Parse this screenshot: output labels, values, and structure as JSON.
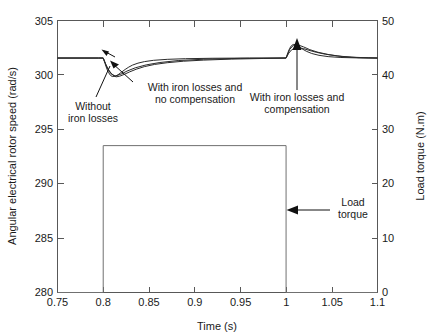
{
  "chart_data": {
    "type": "line",
    "title": "",
    "xlabel": "Time (s)",
    "ylabel": "Angular electrical rotor speed (rad/s)",
    "y2label": "Load torque (N.m)",
    "xlim": [
      0.75,
      1.1
    ],
    "ylim": [
      280,
      305
    ],
    "y2lim": [
      0,
      50
    ],
    "xticks": [
      "0.75",
      "0.8",
      "0.85",
      "0.9",
      "0.95",
      "1",
      "1.05",
      "1.1"
    ],
    "xtick_values": [
      0.75,
      0.8,
      0.85,
      0.9,
      0.95,
      1.0,
      1.05,
      1.1
    ],
    "yticks": [
      "280",
      "285",
      "290",
      "295",
      "300",
      "305"
    ],
    "ytick_values": [
      280,
      285,
      290,
      295,
      300,
      305
    ],
    "y2ticks": [
      "0",
      "10",
      "20",
      "30",
      "40",
      "50"
    ],
    "y2tick_values": [
      0,
      10,
      20,
      30,
      40,
      50
    ],
    "grid": false,
    "legend": "none (in-plot text annotations)",
    "series": [
      {
        "name": "Without iron losses",
        "axis": "left",
        "units": "rad/s",
        "x": [
          0.75,
          0.78,
          0.795,
          0.8,
          0.802,
          0.804,
          0.806,
          0.808,
          0.81,
          0.813,
          0.816,
          0.82,
          0.824,
          0.828,
          0.832,
          0.838,
          0.845,
          0.855,
          0.87,
          0.89,
          0.92,
          0.96,
          0.999,
          1.0,
          1.002,
          1.004,
          1.006,
          1.008,
          1.01,
          1.013,
          1.017,
          1.022,
          1.028,
          1.036,
          1.046,
          1.06,
          1.08,
          1.1
        ],
        "y": [
          301.55,
          301.55,
          301.55,
          301.55,
          301.05,
          300.55,
          300.2,
          299.95,
          299.85,
          299.88,
          300.0,
          300.25,
          300.5,
          300.72,
          300.9,
          301.08,
          301.22,
          301.34,
          301.43,
          301.49,
          301.53,
          301.55,
          301.55,
          301.55,
          302.05,
          302.45,
          302.7,
          302.8,
          302.78,
          302.65,
          302.42,
          302.18,
          301.97,
          301.8,
          301.68,
          301.6,
          301.56,
          301.55
        ]
      },
      {
        "name": "With iron losses and no compensation",
        "axis": "left",
        "units": "rad/s",
        "x": [
          0.75,
          0.78,
          0.795,
          0.8,
          0.803,
          0.806,
          0.81,
          0.814,
          0.818,
          0.823,
          0.829,
          0.836,
          0.845,
          0.856,
          0.87,
          0.888,
          0.91,
          0.94,
          0.975,
          0.999,
          1.0,
          1.003,
          1.006,
          1.01,
          1.014,
          1.019,
          1.025,
          1.033,
          1.043,
          1.056,
          1.072,
          1.09,
          1.1
        ],
        "y": [
          301.55,
          301.55,
          301.55,
          301.55,
          300.95,
          300.45,
          300.0,
          299.82,
          299.88,
          300.05,
          300.28,
          300.52,
          300.76,
          300.96,
          301.12,
          301.26,
          301.36,
          301.45,
          301.51,
          301.55,
          301.55,
          302.0,
          302.3,
          302.48,
          302.5,
          302.42,
          302.26,
          302.08,
          301.9,
          301.74,
          301.63,
          301.57,
          301.55
        ]
      },
      {
        "name": "With iron losses and compensation",
        "axis": "left",
        "units": "rad/s",
        "x": [
          0.75,
          0.795,
          0.8,
          0.804,
          0.808,
          0.813,
          0.819,
          0.826,
          0.835,
          0.847,
          0.862,
          0.882,
          0.91,
          0.95,
          0.999,
          1.0,
          1.004,
          1.008,
          1.013,
          1.019,
          1.026,
          1.035,
          1.047,
          1.062,
          1.08,
          1.1
        ],
        "y": [
          301.55,
          301.55,
          301.55,
          300.7,
          300.15,
          299.9,
          300.05,
          300.35,
          300.65,
          300.92,
          301.14,
          301.32,
          301.44,
          301.52,
          301.55,
          301.55,
          302.35,
          302.72,
          302.76,
          302.58,
          302.32,
          302.08,
          301.86,
          301.68,
          301.58,
          301.55
        ]
      },
      {
        "name": "Load torque",
        "axis": "right",
        "units": "N.m",
        "x": [
          0.75,
          0.8,
          0.8,
          1.0,
          1.0,
          1.1
        ],
        "y": [
          0,
          0,
          27,
          27,
          0,
          0
        ]
      }
    ],
    "annotations": [
      {
        "text": "Without iron losses",
        "points_to_x": 0.806,
        "points_to_y": 300.05
      },
      {
        "text": "With iron losses and no compensation",
        "points_to_x": 0.812,
        "points_to_y": 299.9
      },
      {
        "text": "With iron losses and compensation",
        "points_to_x": 1.006,
        "points_to_y": 302.7
      },
      {
        "text": "Load torque",
        "points_to_x": 1.0,
        "points_to_y": 16.0
      }
    ]
  },
  "annotation_labels": {
    "without_iron_losses_line1": "Without",
    "without_iron_losses_line2": "iron losses",
    "no_compensation_line1": "With iron losses and",
    "no_compensation_line2": "no compensation",
    "compensation_line1": "With iron losses and",
    "compensation_line2": "compensation",
    "load_torque_line1": "Load",
    "load_torque_line2": "torque"
  },
  "axis_titles": {
    "x": "Time (s)",
    "y_left": "Angular electrical rotor speed (rad/s)",
    "y_right": "Load torque (N.m)"
  },
  "x_tick_labels": {
    "t0": "0.75",
    "t1": "0.8",
    "t2": "0.85",
    "t3": "0.9",
    "t4": "0.95",
    "t5": "1",
    "t6": "1.05",
    "t7": "1.1"
  },
  "y_left_tick_labels": {
    "v0": "280",
    "v1": "285",
    "v2": "290",
    "v3": "295",
    "v4": "300",
    "v5": "305"
  },
  "y_right_tick_labels": {
    "v0": "0",
    "v1": "10",
    "v2": "20",
    "v3": "30",
    "v4": "40",
    "v5": "50"
  },
  "colors": {
    "axis": "#585858",
    "data": "#2b2b2b",
    "torque": "#707070",
    "text": "#1a1a1a",
    "background": "#ffffff"
  }
}
